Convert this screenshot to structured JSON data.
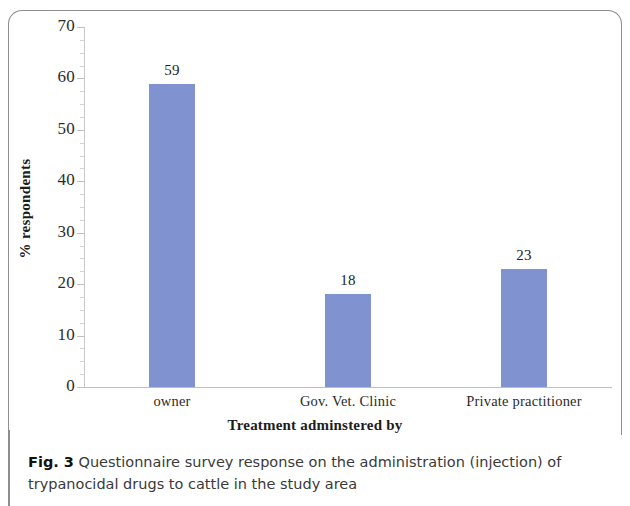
{
  "figure": {
    "caption_prefix": "Fig. 3",
    "caption_text": " Questionnaire survey response on the administration (injection) of trypanocidal drugs to cattle in the study area"
  },
  "chart_data": {
    "type": "bar",
    "title": "",
    "categories": [
      "owner",
      "Gov. Vet. Clinic",
      "Private practitioner"
    ],
    "values": [
      59,
      18,
      23
    ],
    "value_labels": [
      "59",
      "18",
      "23"
    ],
    "xlabel": "Treatment adminstered by",
    "ylabel": "% respondents",
    "ylim": [
      0,
      70
    ],
    "ytick_labels": [
      "0",
      "10",
      "20",
      "30",
      "40",
      "50",
      "60",
      "70"
    ],
    "ytick_values": [
      0,
      10,
      20,
      30,
      40,
      50,
      60,
      70
    ],
    "minor_tick_step": 2.5,
    "grid": false,
    "legend": false,
    "bar_color": "#8092D0",
    "axis_color": "#C9C9CC",
    "text_color": "#2B2B2B"
  }
}
